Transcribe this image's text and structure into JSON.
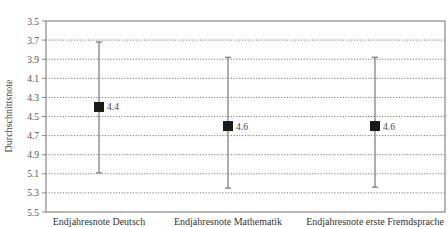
{
  "chart_data": {
    "type": "errorbar",
    "title": "",
    "xlabel": "",
    "ylabel": "Durchschnittsnote",
    "ylim": [
      3.5,
      5.5
    ],
    "y_inverted": true,
    "y_ticks": [
      "3.5",
      "3.7",
      "3.9",
      "4.1",
      "4.3",
      "4.5",
      "4.7",
      "4.9",
      "5.1",
      "5.3",
      "5.5"
    ],
    "grid": "horizontal dotted",
    "legend": "none",
    "categories": [
      "Endjahresnote Deutsch",
      "Endjahresnote Mathematik",
      "Endjahresnote erste Fremdsprache"
    ],
    "series": [
      {
        "name": "Durchschnittsnote",
        "values": [
          4.4,
          4.6,
          4.6
        ],
        "labels": [
          "4.4",
          "4.6",
          "4.6"
        ],
        "error_low": [
          3.72,
          3.88,
          3.88
        ],
        "error_high": [
          5.09,
          5.25,
          5.24
        ]
      }
    ]
  },
  "colors": {
    "marker": "#1a1a1a",
    "errorbar": "#777777",
    "grid": "#555555",
    "axis": "#888888"
  }
}
